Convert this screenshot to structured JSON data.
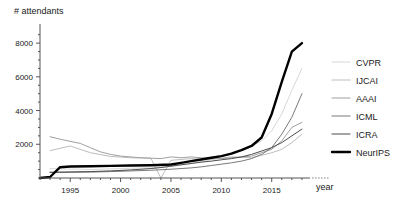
{
  "chart_data": {
    "type": "line",
    "title": "",
    "ylabel": "# attendants",
    "xlabel": "year",
    "grid": false,
    "legend_position": "right",
    "xlim": [
      1992,
      2019
    ],
    "ylim": [
      0,
      8600
    ],
    "x_ticks": [
      1995,
      2000,
      2005,
      2010,
      2015
    ],
    "x_tick_labels": [
      "1995",
      "2000",
      "2005",
      "2010",
      "2015"
    ],
    "x_minor_tick_step": 1,
    "y_ticks": [
      2000,
      4000,
      6000,
      8000
    ],
    "y_tick_labels": [
      "2000",
      "4000",
      "6000",
      "8000"
    ],
    "y_minor_tick_step": 500,
    "series": [
      {
        "name": "CVPR",
        "color": "#d8d8d8",
        "width": 1,
        "x": [
          1993,
          1994,
          1996,
          1997,
          1998,
          1999,
          2000,
          2001,
          2003,
          2004,
          2005,
          2006,
          2007,
          2008,
          2009,
          2010,
          2011,
          2012,
          2013,
          2014,
          2015,
          2016,
          2017,
          2018
        ],
        "values": [
          560,
          540,
          520,
          500,
          520,
          540,
          560,
          580,
          600,
          640,
          700,
          780,
          860,
          960,
          1100,
          1300,
          1500,
          1700,
          1900,
          2200,
          2800,
          3800,
          5200,
          6500
        ]
      },
      {
        "name": "IJCAI",
        "color": "#bdbdbd",
        "width": 1,
        "x": [
          1993,
          1995,
          1997,
          1999,
          2001,
          2003,
          2004,
          2005,
          2007,
          2009,
          2011,
          2013,
          2015,
          2016,
          2017,
          2018
        ],
        "values": [
          1620,
          1900,
          1500,
          1280,
          1200,
          1180,
          0,
          1050,
          1150,
          1100,
          1250,
          1200,
          1500,
          1700,
          2100,
          2600
        ]
      },
      {
        "name": "AAAI",
        "color": "#a0a0a0",
        "width": 1,
        "x": [
          1993,
          1994,
          1996,
          1997,
          1998,
          1999,
          2000,
          2002,
          2004,
          2005,
          2006,
          2007,
          2008,
          2010,
          2011,
          2012,
          2013,
          2014,
          2015,
          2016,
          2017,
          2018
        ],
        "values": [
          2450,
          2300,
          2050,
          1800,
          1550,
          1400,
          1300,
          1200,
          1150,
          1250,
          1200,
          1250,
          1200,
          1150,
          1200,
          1250,
          1300,
          1500,
          1700,
          2200,
          3000,
          3300
        ]
      },
      {
        "name": "ICML",
        "color": "#7a7a7a",
        "width": 1,
        "x": [
          1993,
          1995,
          1997,
          1999,
          2001,
          2003,
          2005,
          2006,
          2007,
          2008,
          2009,
          2010,
          2011,
          2012,
          2013,
          2014,
          2015,
          2016,
          2017,
          2018
        ],
        "values": [
          330,
          340,
          350,
          380,
          420,
          460,
          520,
          560,
          600,
          660,
          740,
          820,
          900,
          1000,
          1150,
          1400,
          1800,
          2600,
          3600,
          5000
        ]
      },
      {
        "name": "ICRA",
        "color": "#4d4d4d",
        "width": 1,
        "x": [
          1993,
          1995,
          1997,
          1999,
          2001,
          2003,
          2004,
          2005,
          2006,
          2007,
          2008,
          2009,
          2010,
          2011,
          2012,
          2013,
          2014,
          2015,
          2016,
          2017,
          2018
        ],
        "values": [
          340,
          360,
          380,
          420,
          480,
          560,
          620,
          700,
          780,
          860,
          940,
          1000,
          1080,
          1150,
          1250,
          1400,
          1600,
          1800,
          2100,
          2500,
          2900
        ]
      },
      {
        "name": "NeurIPS",
        "color": "#000000",
        "width": 2.4,
        "x": [
          1992,
          1993,
          1994,
          1995,
          1997,
          1999,
          2001,
          2003,
          2005,
          2006,
          2007,
          2008,
          2009,
          2010,
          2011,
          2012,
          2013,
          2014,
          2015,
          2016,
          2017,
          2018
        ],
        "values": [
          0,
          60,
          640,
          680,
          700,
          720,
          740,
          760,
          800,
          900,
          1000,
          1100,
          1200,
          1300,
          1450,
          1650,
          1900,
          2400,
          3800,
          5700,
          7500,
          8000
        ]
      }
    ]
  },
  "legend": {
    "items": [
      {
        "label": "CVPR",
        "color": "#d8d8d8"
      },
      {
        "label": "IJCAI",
        "color": "#bdbdbd"
      },
      {
        "label": "AAAI",
        "color": "#a0a0a0"
      },
      {
        "label": "ICML",
        "color": "#7a7a7a"
      },
      {
        "label": "ICRA",
        "color": "#4d4d4d"
      },
      {
        "label": "NeurIPS",
        "color": "#000000"
      }
    ]
  },
  "axes": {
    "y_axis_title": "# attendants",
    "x_axis_title": "year",
    "y_labels": [
      "8000",
      "6000",
      "4000",
      "2000"
    ],
    "x_labels": [
      "1995",
      "2000",
      "2005",
      "2010",
      "2015"
    ]
  }
}
